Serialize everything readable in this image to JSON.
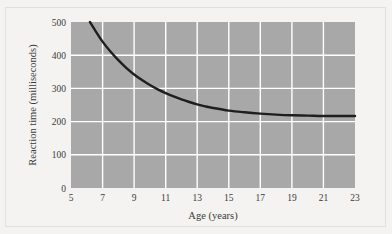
{
  "chart_data": {
    "type": "line",
    "title": "",
    "subtitle": "",
    "xlabel": "Age (years)",
    "ylabel": "Reaction time (milliseconds)",
    "xlim": [
      5,
      23
    ],
    "ylim": [
      0,
      500
    ],
    "xticks": [
      5,
      7,
      9,
      11,
      13,
      15,
      17,
      19,
      21,
      23
    ],
    "yticks": [
      0,
      100,
      200,
      300,
      400,
      500
    ],
    "xtick_labels": [
      "5",
      "7",
      "9",
      "11",
      "13",
      "15",
      "17",
      "19",
      "21",
      "23"
    ],
    "ytick_labels": [
      "0",
      "100",
      "200",
      "300",
      "400",
      "500"
    ],
    "grid": true,
    "grid_color": "#ffffff",
    "plot_background": "#a8a8a8",
    "figure_background": "#f4f3f1",
    "legend": null,
    "legend_position": "none",
    "series": [
      {
        "name": "Reaction time",
        "color": "#1e1e1e",
        "line_width": 2.4,
        "x": [
          6.2,
          6.5,
          7,
          7.5,
          8,
          8.5,
          9,
          9.5,
          10,
          10.5,
          11,
          11.5,
          12,
          12.5,
          13,
          13.5,
          14,
          15,
          16,
          17,
          18,
          19,
          20,
          21,
          22,
          23
        ],
        "y": [
          500,
          477,
          441,
          411,
          385,
          362,
          342,
          325,
          310,
          297,
          286,
          276,
          267,
          259,
          252,
          246,
          241,
          233,
          228,
          224,
          221,
          219,
          218,
          217,
          217,
          217
        ]
      }
    ],
    "annotations": [],
    "asymptote_value": 217,
    "curve_start": {
      "x": 6.2,
      "y": 500
    },
    "curve_end": {
      "x": 23,
      "y": 217
    }
  },
  "axes": {
    "y_axis_title": "Reaction time (milliseconds)",
    "x_axis_title": "Age (years)"
  }
}
